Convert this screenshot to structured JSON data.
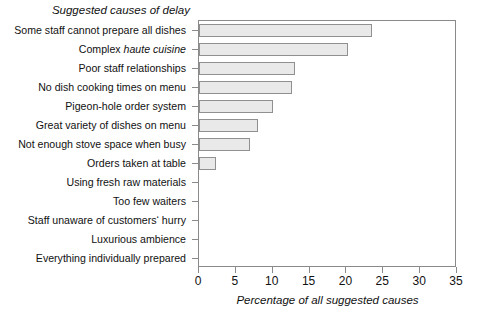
{
  "chart_data": {
    "type": "bar",
    "orientation": "horizontal",
    "title": "Suggested causes of delay",
    "xlabel": "Percentage of all suggested causes",
    "ylabel": "",
    "xlim": [
      0,
      35
    ],
    "xticks": [
      "0",
      "5",
      "10",
      "15",
      "20",
      "25",
      "30",
      "35"
    ],
    "xtick_values": [
      0,
      5,
      10,
      15,
      20,
      25,
      30,
      35
    ],
    "grid": false,
    "legend": false,
    "bar_fill_color": "#e9e9e9",
    "bar_edge_color": "#909090",
    "axis_color": "#8a8a8a",
    "categories": [
      "Some staff cannot prepare all dishes",
      "Complex haute cuisine",
      "Poor staff relationships",
      "No dish cooking times on menu",
      "Pigeon-hole order system",
      "Great variety of dishes on menu",
      "Not enough stove space when busy",
      "Orders taken at table",
      "Using fresh raw materials",
      "Too few waiters",
      "Staff unaware of customers' hurry",
      "Luxurious ambience",
      "Everything individually prepared"
    ],
    "category_parts": [
      [
        {
          "text": "Some staff cannot prepare all dishes",
          "italic": false
        }
      ],
      [
        {
          "text": "Complex ",
          "italic": false
        },
        {
          "text": "haute cuisine",
          "italic": true
        }
      ],
      [
        {
          "text": "Poor staff relationships",
          "italic": false
        }
      ],
      [
        {
          "text": "No dish cooking times on menu",
          "italic": false
        }
      ],
      [
        {
          "text": "Pigeon-hole order system",
          "italic": false
        }
      ],
      [
        {
          "text": "Great variety of dishes on menu",
          "italic": false
        }
      ],
      [
        {
          "text": "Not enough stove space when busy",
          "italic": false
        }
      ],
      [
        {
          "text": "Orders taken at table",
          "italic": false
        }
      ],
      [
        {
          "text": "Using fresh raw materials",
          "italic": false
        }
      ],
      [
        {
          "text": "Too few waiters",
          "italic": false
        }
      ],
      [
        {
          "text": "Staff unaware of customers‘ hurry",
          "italic": false
        }
      ],
      [
        {
          "text": "Luxurious ambience",
          "italic": false
        }
      ],
      [
        {
          "text": "Everything individually prepared",
          "italic": false
        }
      ]
    ],
    "values": [
      23.5,
      20.2,
      13.0,
      12.6,
      10.0,
      8.0,
      6.9,
      2.3,
      0,
      0,
      0,
      0,
      0
    ]
  }
}
